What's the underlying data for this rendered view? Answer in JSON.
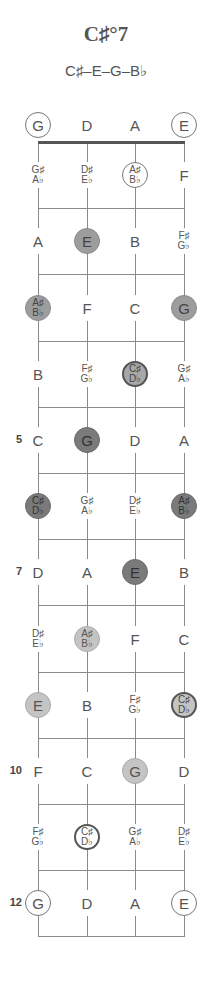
{
  "chord": {
    "title": "C♯°7",
    "notes_label": "C♯–E–G–B♭"
  },
  "strings": [
    "G",
    "D",
    "A",
    "E"
  ],
  "fret_numbers": [
    {
      "fret": 5,
      "label": "5"
    },
    {
      "fret": 7,
      "label": "7"
    },
    {
      "fret": 10,
      "label": "10"
    },
    {
      "fret": 12,
      "label": "12"
    }
  ],
  "rows": [
    {
      "fret": 0,
      "cells": [
        {
          "top": "G",
          "style": "outline"
        },
        {
          "top": "D",
          "style": "none"
        },
        {
          "top": "A",
          "style": "none"
        },
        {
          "top": "E",
          "style": "outline"
        }
      ]
    },
    {
      "fret": 1,
      "cells": [
        {
          "top": "G♯",
          "bottom": "A♭",
          "style": "none"
        },
        {
          "top": "D♯",
          "bottom": "E♭",
          "style": "none"
        },
        {
          "top": "A♯",
          "bottom": "B♭",
          "style": "outline"
        },
        {
          "top": "F",
          "style": "none"
        }
      ]
    },
    {
      "fret": 2,
      "cells": [
        {
          "top": "A",
          "style": "none"
        },
        {
          "top": "E",
          "style": "mid"
        },
        {
          "top": "B",
          "style": "none"
        },
        {
          "top": "F♯",
          "bottom": "G♭",
          "style": "none"
        }
      ]
    },
    {
      "fret": 3,
      "cells": [
        {
          "top": "A♯",
          "bottom": "B♭",
          "style": "mid"
        },
        {
          "top": "F",
          "style": "none"
        },
        {
          "top": "C",
          "style": "none"
        },
        {
          "top": "G",
          "style": "mid"
        }
      ]
    },
    {
      "fret": 4,
      "cells": [
        {
          "top": "B",
          "style": "none"
        },
        {
          "top": "F♯",
          "bottom": "G♭",
          "style": "none"
        },
        {
          "top": "C♯",
          "bottom": "D♭",
          "style": "midring"
        },
        {
          "top": "G♯",
          "bottom": "A♭",
          "style": "none"
        }
      ]
    },
    {
      "fret": 5,
      "cells": [
        {
          "top": "C",
          "style": "none"
        },
        {
          "top": "G",
          "style": "dark"
        },
        {
          "top": "D",
          "style": "none"
        },
        {
          "top": "A",
          "style": "none"
        }
      ]
    },
    {
      "fret": 6,
      "cells": [
        {
          "top": "C♯",
          "bottom": "D♭",
          "style": "dark"
        },
        {
          "top": "G♯",
          "bottom": "A♭",
          "style": "none"
        },
        {
          "top": "D♯",
          "bottom": "E♭",
          "style": "none"
        },
        {
          "top": "A♯",
          "bottom": "B♭",
          "style": "dark"
        }
      ]
    },
    {
      "fret": 7,
      "cells": [
        {
          "top": "D",
          "style": "none"
        },
        {
          "top": "A",
          "style": "none"
        },
        {
          "top": "E",
          "style": "dark"
        },
        {
          "top": "B",
          "style": "none"
        }
      ]
    },
    {
      "fret": 8,
      "cells": [
        {
          "top": "D♯",
          "bottom": "E♭",
          "style": "none"
        },
        {
          "top": "A♯",
          "bottom": "B♭",
          "style": "light"
        },
        {
          "top": "F",
          "style": "none"
        },
        {
          "top": "C",
          "style": "none"
        }
      ]
    },
    {
      "fret": 9,
      "cells": [
        {
          "top": "E",
          "style": "light"
        },
        {
          "top": "B",
          "style": "none"
        },
        {
          "top": "F♯",
          "bottom": "G♭",
          "style": "none"
        },
        {
          "top": "C♯",
          "bottom": "D♭",
          "style": "lightring"
        }
      ]
    },
    {
      "fret": 10,
      "cells": [
        {
          "top": "F",
          "style": "none"
        },
        {
          "top": "C",
          "style": "none"
        },
        {
          "top": "G",
          "style": "light"
        },
        {
          "top": "D",
          "style": "none"
        }
      ]
    },
    {
      "fret": 11,
      "cells": [
        {
          "top": "F♯",
          "bottom": "G♭",
          "style": "none"
        },
        {
          "top": "C♯",
          "bottom": "D♭",
          "style": "ring"
        },
        {
          "top": "G♯",
          "bottom": "A♭",
          "style": "none"
        },
        {
          "top": "D♯",
          "bottom": "E♭",
          "style": "none"
        }
      ]
    },
    {
      "fret": 12,
      "cells": [
        {
          "top": "G",
          "style": "outline"
        },
        {
          "top": "D",
          "style": "none"
        },
        {
          "top": "A",
          "style": "none"
        },
        {
          "top": "E",
          "style": "outline"
        }
      ]
    }
  ],
  "colors": {
    "dark": "#7a7a7a",
    "mid": "#9d9d9d",
    "light": "#c4c4c4",
    "line": "#8a8a8a"
  }
}
